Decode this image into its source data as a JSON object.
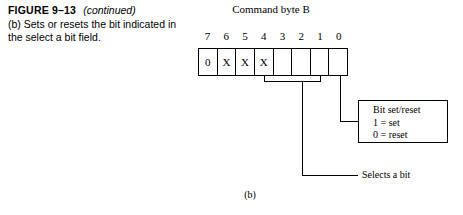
{
  "caption": {
    "figure_label": "FIGURE 9–13",
    "continued": "(continued)",
    "body": "(b) Sets or resets the bit indicated in the select a bit field."
  },
  "diagram": {
    "title": "Command byte B",
    "bit_numbers": [
      "7",
      "6",
      "5",
      "4",
      "3",
      "2",
      "1",
      "0"
    ],
    "bit_values": [
      "0",
      "X",
      "X",
      "X",
      "",
      "",
      "",
      ""
    ],
    "callout": {
      "line1": "Bit set/reset",
      "line2": "1 = set",
      "line3": "0 = reset"
    },
    "select_label": "Selects a bit",
    "subfigure_label": "(b)"
  }
}
